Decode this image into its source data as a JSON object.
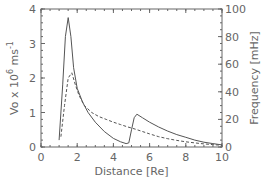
{
  "chart_data": {
    "type": "line",
    "title": "",
    "xlabel": "Distance [Re]",
    "ylabel_left": "Vo x 10^6 ms^-1",
    "ylabel_right": "Frequency [mHz]",
    "xlim": [
      0,
      10
    ],
    "ylim_left": [
      0,
      4
    ],
    "ylim_right": [
      0,
      100
    ],
    "x_ticks": [
      "0",
      "2",
      "4",
      "6",
      "8",
      "10"
    ],
    "y_left_ticks": [
      "0",
      "1",
      "2",
      "3",
      "4"
    ],
    "y_right_ticks": [
      "0",
      "20",
      "40",
      "60",
      "80",
      "100"
    ],
    "grid": false,
    "legend": null,
    "series": [
      {
        "name": "solid",
        "style": "solid",
        "axis": "left",
        "x": [
          1.0,
          1.2,
          1.35,
          1.5,
          1.65,
          1.8,
          2.0,
          2.3,
          2.6,
          3.0,
          3.5,
          4.0,
          4.4,
          4.7,
          4.85,
          5.0,
          5.15,
          5.3,
          5.6,
          6.0,
          6.5,
          7.0,
          7.5,
          8.0,
          8.5,
          9.0,
          9.5,
          10.0
        ],
        "values": [
          0.2,
          1.8,
          3.2,
          3.75,
          3.2,
          2.3,
          1.7,
          1.3,
          1.0,
          0.72,
          0.45,
          0.25,
          0.15,
          0.1,
          0.12,
          0.5,
          0.85,
          0.95,
          0.85,
          0.72,
          0.58,
          0.46,
          0.36,
          0.28,
          0.2,
          0.14,
          0.1,
          0.06
        ]
      },
      {
        "name": "dashed",
        "style": "dashed",
        "axis": "left",
        "x": [
          1.1,
          1.3,
          1.5,
          1.7,
          1.9,
          2.1,
          2.4,
          2.8,
          3.2,
          3.6,
          4.0,
          4.4,
          4.8,
          5.0,
          5.2,
          5.6,
          6.0,
          6.5,
          7.0,
          7.5,
          8.0,
          8.5,
          9.0,
          9.5,
          10.0
        ],
        "values": [
          0.3,
          1.2,
          2.0,
          2.15,
          1.8,
          1.5,
          1.2,
          1.0,
          0.88,
          0.8,
          0.72,
          0.65,
          0.58,
          0.55,
          0.52,
          0.45,
          0.38,
          0.3,
          0.24,
          0.19,
          0.15,
          0.12,
          0.09,
          0.07,
          0.05
        ]
      }
    ]
  },
  "plot": {
    "left_px": 41,
    "right_px": 222,
    "top_px": 9,
    "bottom_px": 147,
    "line_color": "#555555",
    "frame_color": "#666666"
  }
}
